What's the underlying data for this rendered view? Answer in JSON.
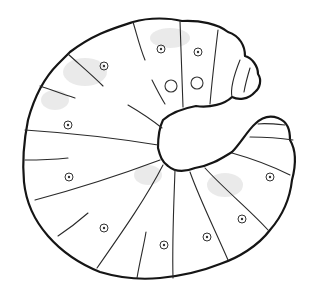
{
  "image": {
    "subject": "line drawing of a C-shaped beetle grub (larva)",
    "background": "#ffffff",
    "line_color": "#151515",
    "shading_color": "#d9d9d9",
    "segment_count": 13,
    "spiracle_count": 9
  }
}
